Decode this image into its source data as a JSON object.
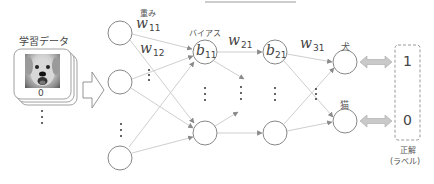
{
  "training_data": {
    "title": "学習データ",
    "image_label": "0",
    "image_subject": "dog-photo"
  },
  "network": {
    "weight_caption": "重み",
    "bias_caption": "バイアス",
    "weights": {
      "w11": {
        "base": "w",
        "sub": "11"
      },
      "w12": {
        "base": "w",
        "sub": "12"
      },
      "w21": {
        "base": "w",
        "sub": "21"
      },
      "w31": {
        "base": "w",
        "sub": "31"
      }
    },
    "biases": {
      "b11": {
        "base": "b",
        "sub": "11"
      },
      "b21": {
        "base": "b",
        "sub": "21"
      }
    },
    "outputs": [
      {
        "label": "犬"
      },
      {
        "label": "猫"
      }
    ]
  },
  "ground_truth": {
    "values": [
      "1",
      "0"
    ],
    "caption_line1": "正解",
    "caption_line2": "(ラベル)"
  },
  "colors": {
    "node_stroke": "#888888",
    "edge": "#c8c8c8",
    "arrowhead": "#888888",
    "double_arrow_fill": "#c9c9c9",
    "double_arrow_stroke": "#a0a0a0",
    "dashed_box": "#9a9a9a"
  }
}
